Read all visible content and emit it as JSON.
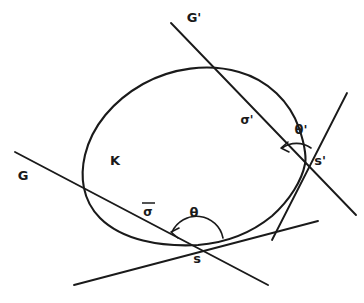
{
  "figure": {
    "background_color": "#ffffff",
    "ink_color": "#1a1a1a"
  },
  "labels": {
    "curve_K": "K",
    "line_G": "G",
    "line_G_prime": "G'",
    "sigma": "σ",
    "sigma_prime": "σ'",
    "theta": "θ",
    "theta_prime": "θ'",
    "point_s": "s",
    "point_s_prime": "s'"
  },
  "elements": {
    "curve": {
      "name": "K",
      "kind": "closed convex oval"
    },
    "lines": [
      {
        "name": "G",
        "label": "G",
        "kind": "secant"
      },
      {
        "name": "G'",
        "label": "G'",
        "kind": "secant"
      },
      {
        "name": "tangent at s",
        "label": "",
        "kind": "tangent"
      },
      {
        "name": "tangent at s'",
        "label": "",
        "kind": "tangent"
      }
    ],
    "points": [
      {
        "name": "s",
        "label": "s"
      },
      {
        "name": "s'",
        "label": "s'"
      }
    ],
    "angles": [
      {
        "name": "theta",
        "label": "θ",
        "at": "s"
      },
      {
        "name": "theta-prime",
        "label": "θ'",
        "at": "s'"
      }
    ],
    "directions": [
      {
        "name": "sigma",
        "label": "σ",
        "on": "G"
      },
      {
        "name": "sigma-prime",
        "label": "σ'",
        "on": "G'"
      }
    ]
  }
}
